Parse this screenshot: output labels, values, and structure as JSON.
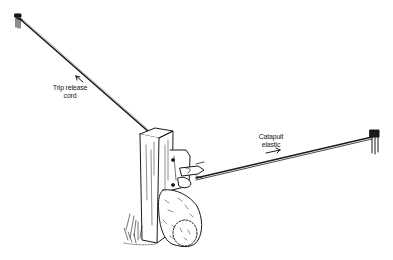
{
  "figure": {
    "type": "line-drawing illustration",
    "labels": {
      "trip_line1": "Trip release",
      "trip_line2": "cord",
      "catapult_line1": "Catapult",
      "catapult_line2": "elastic"
    },
    "components": [
      "left-anchor-peg",
      "trip-release-cord",
      "wooden-post",
      "release-mechanism",
      "bundle-sack",
      "grass-tuft",
      "catapult-elastic",
      "right-anchor-peg"
    ],
    "colors": {
      "ink": "#1a1a1a",
      "background": "#ffffff"
    }
  }
}
